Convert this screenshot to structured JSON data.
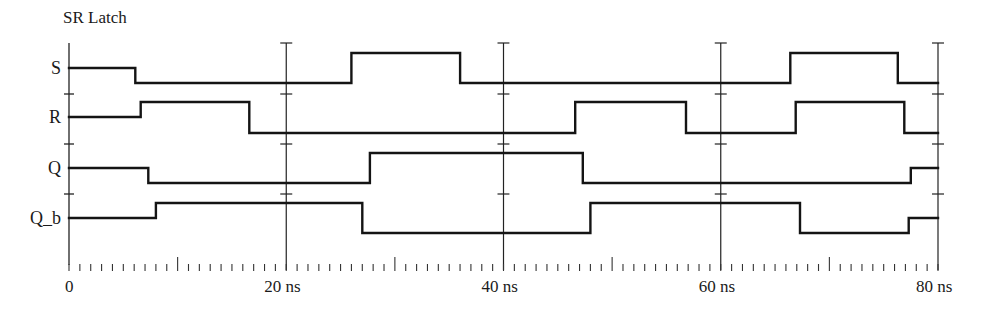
{
  "title": "SR Latch",
  "time_unit": "ns",
  "time_range": [
    0,
    80
  ],
  "axis_labels": [
    {
      "t": 0,
      "label": "0"
    },
    {
      "t": 20,
      "label": "20 ns"
    },
    {
      "t": 40,
      "label": "40 ns"
    },
    {
      "t": 60,
      "label": "60 ns"
    },
    {
      "t": 80,
      "label": "80 ns"
    }
  ],
  "gridlines_ns": [
    20,
    40,
    60,
    80
  ],
  "minor_tick_step_ns": 1,
  "mid_tick_every_ns": 10,
  "signals": [
    {
      "name": "S",
      "label": "S",
      "initial": "X",
      "transitions": [
        {
          "t": 6.1,
          "value": "0"
        },
        {
          "t": 26.0,
          "value": "1"
        },
        {
          "t": 36.0,
          "value": "0"
        },
        {
          "t": 66.4,
          "value": "1"
        },
        {
          "t": 76.3,
          "value": "0"
        }
      ]
    },
    {
      "name": "R",
      "label": "R",
      "initial": "X",
      "transitions": [
        {
          "t": 6.6,
          "value": "1"
        },
        {
          "t": 16.6,
          "value": "0"
        },
        {
          "t": 46.6,
          "value": "1"
        },
        {
          "t": 56.8,
          "value": "0"
        },
        {
          "t": 66.9,
          "value": "1"
        },
        {
          "t": 76.9,
          "value": "0"
        }
      ]
    },
    {
      "name": "Q",
      "label": "Q",
      "initial": "X",
      "transitions": [
        {
          "t": 7.3,
          "value": "0"
        },
        {
          "t": 27.7,
          "value": "1"
        },
        {
          "t": 47.3,
          "value": "0"
        },
        {
          "t": 77.5,
          "value": "X"
        }
      ]
    },
    {
      "name": "Q_b",
      "label": "Q_b",
      "initial": "X",
      "transitions": [
        {
          "t": 8.0,
          "value": "1"
        },
        {
          "t": 27.0,
          "value": "0"
        },
        {
          "t": 48.0,
          "value": "1"
        },
        {
          "t": 67.3,
          "value": "0"
        },
        {
          "t": 77.3,
          "value": "X"
        }
      ]
    }
  ],
  "chart_data": {
    "type": "timing-diagram",
    "title": "SR Latch",
    "xlabel": "time (ns)",
    "xlim": [
      0,
      80
    ],
    "x_ticks": [
      "0",
      "20 ns",
      "40 ns",
      "60 ns",
      "80 ns"
    ],
    "grid": true,
    "series": [
      {
        "name": "S",
        "initial": "X",
        "edges": [
          [
            6.1,
            "0"
          ],
          [
            26.0,
            "1"
          ],
          [
            36.0,
            "0"
          ],
          [
            66.4,
            "1"
          ],
          [
            76.3,
            "0"
          ]
        ]
      },
      {
        "name": "R",
        "initial": "X",
        "edges": [
          [
            6.6,
            "1"
          ],
          [
            16.6,
            "0"
          ],
          [
            46.6,
            "1"
          ],
          [
            56.8,
            "0"
          ],
          [
            66.9,
            "1"
          ],
          [
            76.9,
            "0"
          ]
        ]
      },
      {
        "name": "Q",
        "initial": "X",
        "edges": [
          [
            7.3,
            "0"
          ],
          [
            27.7,
            "1"
          ],
          [
            47.3,
            "0"
          ],
          [
            77.5,
            "X"
          ]
        ]
      },
      {
        "name": "Q_b",
        "initial": "X",
        "edges": [
          [
            8.0,
            "1"
          ],
          [
            27.0,
            "0"
          ],
          [
            48.0,
            "1"
          ],
          [
            67.3,
            "0"
          ],
          [
            77.3,
            "X"
          ]
        ]
      }
    ]
  }
}
